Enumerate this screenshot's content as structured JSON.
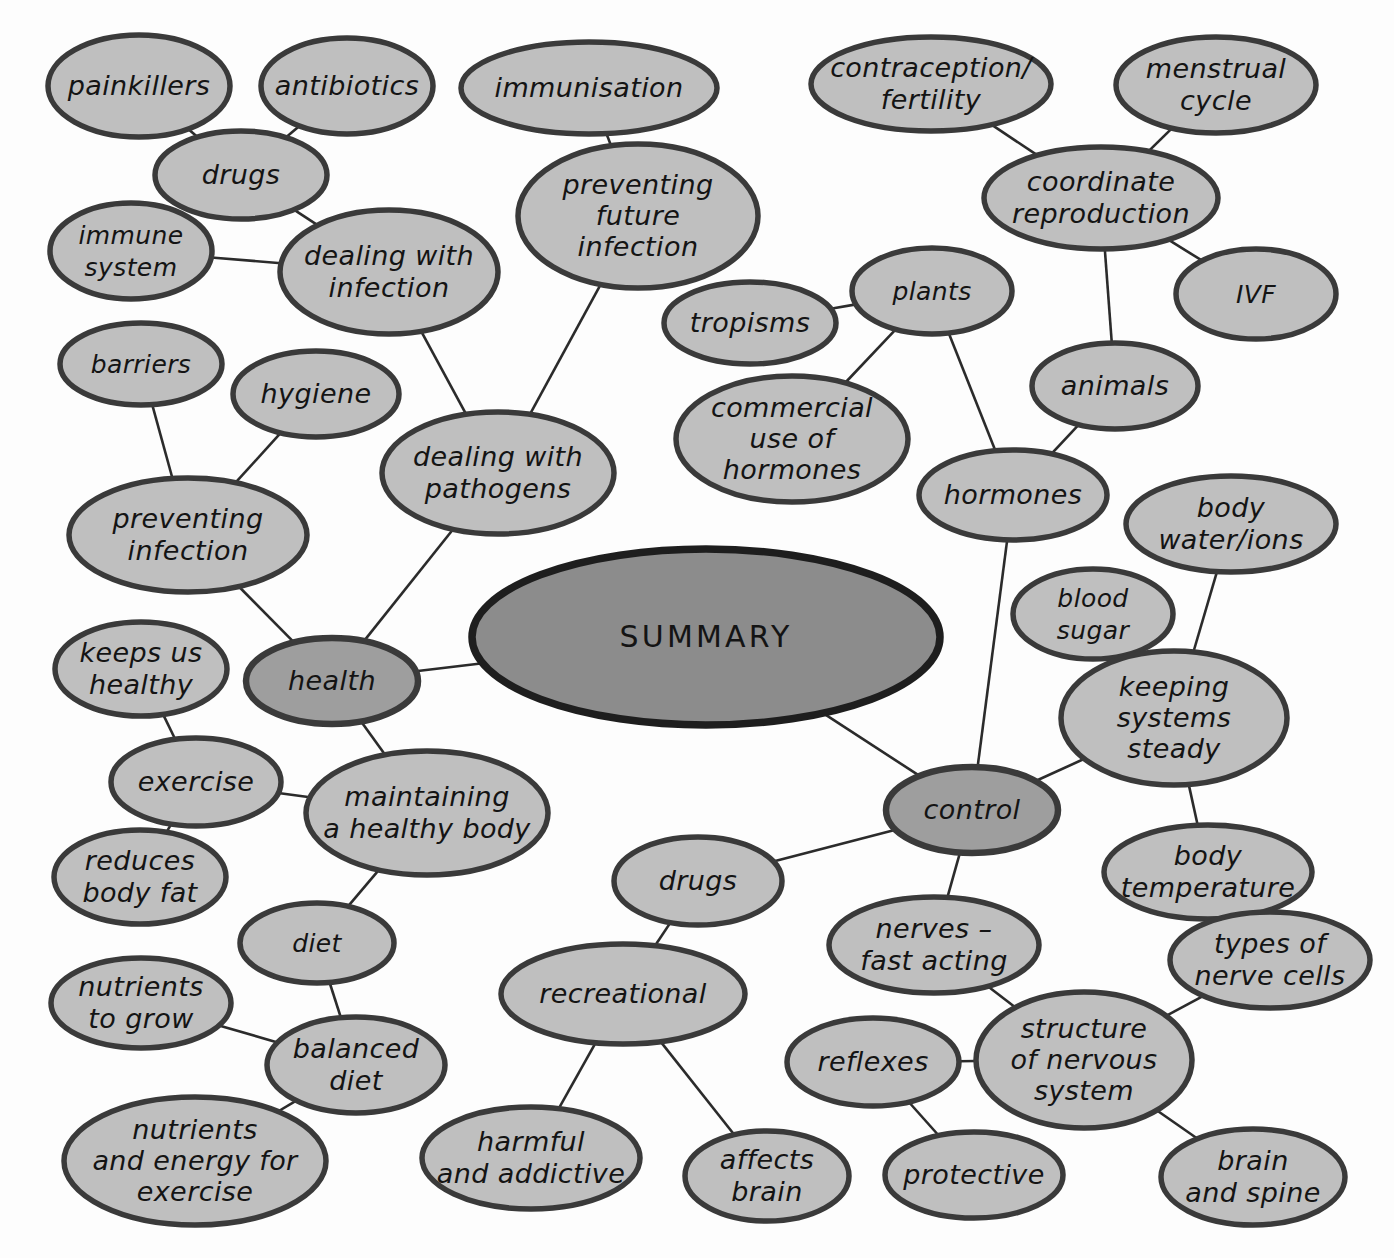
{
  "diagram": {
    "title": "SUMMARY",
    "type": "mind-map",
    "colors": {
      "center_fill": "#8c8c8c",
      "level1_fill": "#9e9e9e",
      "node_fill": "#bfbfbf",
      "stroke": "#3a3a3a",
      "edge": "#2b2b2b",
      "text": "#141414",
      "background": "#ffffff"
    },
    "nodes": [
      {
        "id": "summary",
        "label": "SUMMARY",
        "lines": [
          "SUMMARY"
        ],
        "cx": 706,
        "cy": 637,
        "rx": 234,
        "ry": 88,
        "tier": "center"
      },
      {
        "id": "health",
        "label": "health",
        "lines": [
          "health"
        ],
        "cx": 332,
        "cy": 681,
        "rx": 86,
        "ry": 43,
        "tier": "level1"
      },
      {
        "id": "control",
        "label": "control",
        "lines": [
          "control"
        ],
        "cx": 972,
        "cy": 810,
        "rx": 86,
        "ry": 43,
        "tier": "level1"
      },
      {
        "id": "painkillers",
        "label": "painkillers",
        "lines": [
          "painkillers"
        ],
        "cx": 139,
        "cy": 86,
        "rx": 91,
        "ry": 51,
        "tier": "node"
      },
      {
        "id": "antibiotics",
        "label": "antibiotics",
        "lines": [
          "antibiotics"
        ],
        "cx": 347,
        "cy": 86,
        "rx": 86,
        "ry": 48,
        "tier": "node"
      },
      {
        "id": "drugs_top",
        "label": "drugs",
        "lines": [
          "drugs"
        ],
        "cx": 241,
        "cy": 175,
        "rx": 86,
        "ry": 44,
        "tier": "node"
      },
      {
        "id": "immune",
        "label": "immune system",
        "lines": [
          "immune",
          "system"
        ],
        "cx": 131,
        "cy": 251,
        "rx": 81,
        "ry": 48,
        "tier": "node"
      },
      {
        "id": "dealinfect",
        "label": "dealing with infection",
        "lines": [
          "dealing with",
          "infection"
        ],
        "cx": 389,
        "cy": 272,
        "rx": 109,
        "ry": 62,
        "tier": "node"
      },
      {
        "id": "barriers",
        "label": "barriers",
        "lines": [
          "barriers"
        ],
        "cx": 141,
        "cy": 364,
        "rx": 81,
        "ry": 41,
        "tier": "node"
      },
      {
        "id": "hygiene",
        "label": "hygiene",
        "lines": [
          "hygiene"
        ],
        "cx": 316,
        "cy": 394,
        "rx": 83,
        "ry": 43,
        "tier": "node"
      },
      {
        "id": "previnfect",
        "label": "preventing infection",
        "lines": [
          "preventing",
          "infection"
        ],
        "cx": 188,
        "cy": 535,
        "rx": 119,
        "ry": 57,
        "tier": "node"
      },
      {
        "id": "immunisation",
        "label": "immunisation",
        "lines": [
          "immunisation"
        ],
        "cx": 589,
        "cy": 88,
        "rx": 128,
        "ry": 46,
        "tier": "node"
      },
      {
        "id": "prevfuture",
        "label": "preventing future infection",
        "lines": [
          "preventing",
          "future",
          "infection"
        ],
        "cx": 638,
        "cy": 216,
        "rx": 120,
        "ry": 72,
        "tier": "node"
      },
      {
        "id": "dealpath",
        "label": "dealing with pathogens",
        "lines": [
          "dealing with",
          "pathogens"
        ],
        "cx": 498,
        "cy": 473,
        "rx": 116,
        "ry": 61,
        "tier": "node"
      },
      {
        "id": "keepshealthy",
        "label": "keeps us healthy",
        "lines": [
          "keeps us",
          "healthy"
        ],
        "cx": 141,
        "cy": 669,
        "rx": 86,
        "ry": 47,
        "tier": "node"
      },
      {
        "id": "exercise",
        "label": "exercise",
        "lines": [
          "exercise"
        ],
        "cx": 196,
        "cy": 782,
        "rx": 85,
        "ry": 44,
        "tier": "node"
      },
      {
        "id": "reducesfat",
        "label": "reduces body fat",
        "lines": [
          "reduces",
          "body fat"
        ],
        "cx": 140,
        "cy": 877,
        "rx": 86,
        "ry": 47,
        "tier": "node"
      },
      {
        "id": "maintain",
        "label": "maintaining a healthy body",
        "lines": [
          "maintaining",
          "a healthy body"
        ],
        "cx": 427,
        "cy": 813,
        "rx": 121,
        "ry": 62,
        "tier": "node"
      },
      {
        "id": "diet",
        "label": "diet",
        "lines": [
          "diet"
        ],
        "cx": 317,
        "cy": 943,
        "rx": 77,
        "ry": 40,
        "tier": "node"
      },
      {
        "id": "nutgrow",
        "label": "nutrients to grow",
        "lines": [
          "nutrients",
          "to grow"
        ],
        "cx": 141,
        "cy": 1003,
        "rx": 90,
        "ry": 45,
        "tier": "node"
      },
      {
        "id": "baldiet",
        "label": "balanced diet",
        "lines": [
          "balanced",
          "diet"
        ],
        "cx": 356,
        "cy": 1065,
        "rx": 89,
        "ry": 48,
        "tier": "node"
      },
      {
        "id": "nutenergy",
        "label": "nutrients and energy for exercise",
        "lines": [
          "nutrients",
          "and energy for",
          "exercise"
        ],
        "cx": 195,
        "cy": 1161,
        "rx": 131,
        "ry": 64,
        "tier": "node"
      },
      {
        "id": "drugs_bot",
        "label": "drugs",
        "lines": [
          "drugs"
        ],
        "cx": 698,
        "cy": 881,
        "rx": 84,
        "ry": 44,
        "tier": "node"
      },
      {
        "id": "recreational",
        "label": "recreational",
        "lines": [
          "recreational"
        ],
        "cx": 623,
        "cy": 994,
        "rx": 122,
        "ry": 50,
        "tier": "node"
      },
      {
        "id": "harmful",
        "label": "harmful and addictive",
        "lines": [
          "harmful",
          "and addictive"
        ],
        "cx": 531,
        "cy": 1158,
        "rx": 109,
        "ry": 51,
        "tier": "node"
      },
      {
        "id": "affects",
        "label": "affects brain",
        "lines": [
          "affects",
          "brain"
        ],
        "cx": 767,
        "cy": 1176,
        "rx": 82,
        "ry": 45,
        "tier": "node"
      },
      {
        "id": "tropisms",
        "label": "tropisms",
        "lines": [
          "tropisms"
        ],
        "cx": 750,
        "cy": 323,
        "rx": 86,
        "ry": 41,
        "tier": "node"
      },
      {
        "id": "plants",
        "label": "plants",
        "lines": [
          "plants"
        ],
        "cx": 932,
        "cy": 291,
        "rx": 80,
        "ry": 43,
        "tier": "node"
      },
      {
        "id": "commuse",
        "label": "commercial use of hormones",
        "lines": [
          "commercial",
          "use of",
          "hormones"
        ],
        "cx": 792,
        "cy": 439,
        "rx": 116,
        "ry": 63,
        "tier": "node"
      },
      {
        "id": "contracept",
        "label": "contraception/ fertility",
        "lines": [
          "contraception/",
          "fertility"
        ],
        "cx": 931,
        "cy": 84,
        "rx": 120,
        "ry": 47,
        "tier": "node"
      },
      {
        "id": "menstrual",
        "label": "menstrual cycle",
        "lines": [
          "menstrual",
          "cycle"
        ],
        "cx": 1216,
        "cy": 85,
        "rx": 100,
        "ry": 48,
        "tier": "node"
      },
      {
        "id": "coordrepro",
        "label": "coordinate reproduction",
        "lines": [
          "coordinate",
          "reproduction"
        ],
        "cx": 1101,
        "cy": 198,
        "rx": 117,
        "ry": 51,
        "tier": "node"
      },
      {
        "id": "ivf",
        "label": "IVF",
        "lines": [
          "IVF"
        ],
        "cx": 1256,
        "cy": 294,
        "rx": 80,
        "ry": 45,
        "tier": "node"
      },
      {
        "id": "animals",
        "label": "animals",
        "lines": [
          "animals"
        ],
        "cx": 1115,
        "cy": 386,
        "rx": 83,
        "ry": 43,
        "tier": "node"
      },
      {
        "id": "hormones",
        "label": "hormones",
        "lines": [
          "hormones"
        ],
        "cx": 1013,
        "cy": 495,
        "rx": 94,
        "ry": 45,
        "tier": "node"
      },
      {
        "id": "bodywater",
        "label": "body water/ions",
        "lines": [
          "body",
          "water/ions"
        ],
        "cx": 1231,
        "cy": 524,
        "rx": 105,
        "ry": 48,
        "tier": "node"
      },
      {
        "id": "bloodsugar",
        "label": "blood sugar",
        "lines": [
          "blood",
          "sugar"
        ],
        "cx": 1093,
        "cy": 614,
        "rx": 80,
        "ry": 45,
        "tier": "node"
      },
      {
        "id": "keepsteady",
        "label": "keeping systems steady",
        "lines": [
          "keeping",
          "systems",
          "steady"
        ],
        "cx": 1174,
        "cy": 718,
        "rx": 113,
        "ry": 67,
        "tier": "node"
      },
      {
        "id": "bodytemp",
        "label": "body temperature",
        "lines": [
          "body",
          "temperature"
        ],
        "cx": 1208,
        "cy": 872,
        "rx": 104,
        "ry": 47,
        "tier": "node"
      },
      {
        "id": "nervesfast",
        "label": "nerves – fast acting",
        "lines": [
          "nerves –",
          "fast acting"
        ],
        "cx": 934,
        "cy": 945,
        "rx": 105,
        "ry": 48,
        "tier": "node"
      },
      {
        "id": "typesnerve",
        "label": "types of nerve cells",
        "lines": [
          "types of",
          "nerve cells"
        ],
        "cx": 1270,
        "cy": 960,
        "rx": 100,
        "ry": 48,
        "tier": "node"
      },
      {
        "id": "reflexes",
        "label": "reflexes",
        "lines": [
          "reflexes"
        ],
        "cx": 873,
        "cy": 1062,
        "rx": 86,
        "ry": 44,
        "tier": "node"
      },
      {
        "id": "structnerv",
        "label": "structure of nervous system",
        "lines": [
          "structure",
          "of nervous",
          "system"
        ],
        "cx": 1084,
        "cy": 1060,
        "rx": 108,
        "ry": 68,
        "tier": "node"
      },
      {
        "id": "protective",
        "label": "protective",
        "lines": [
          "protective"
        ],
        "cx": 974,
        "cy": 1175,
        "rx": 89,
        "ry": 43,
        "tier": "node"
      },
      {
        "id": "brainspine",
        "label": "brain and spine",
        "lines": [
          "brain",
          "and spine"
        ],
        "cx": 1253,
        "cy": 1177,
        "rx": 92,
        "ry": 48,
        "tier": "node"
      }
    ],
    "edges": [
      [
        "painkillers",
        "drugs_top"
      ],
      [
        "antibiotics",
        "drugs_top"
      ],
      [
        "drugs_top",
        "dealinfect"
      ],
      [
        "immune",
        "dealinfect"
      ],
      [
        "dealinfect",
        "dealpath"
      ],
      [
        "barriers",
        "previnfect"
      ],
      [
        "hygiene",
        "previnfect"
      ],
      [
        "previnfect",
        "health"
      ],
      [
        "immunisation",
        "prevfuture"
      ],
      [
        "prevfuture",
        "dealpath"
      ],
      [
        "dealpath",
        "health"
      ],
      [
        "health",
        "summary"
      ],
      [
        "keepshealthy",
        "exercise"
      ],
      [
        "exercise",
        "reducesfat"
      ],
      [
        "exercise",
        "maintain"
      ],
      [
        "health",
        "maintain"
      ],
      [
        "maintain",
        "diet"
      ],
      [
        "diet",
        "baldiet"
      ],
      [
        "nutgrow",
        "baldiet"
      ],
      [
        "baldiet",
        "nutenergy"
      ],
      [
        "drugs_bot",
        "recreational"
      ],
      [
        "drugs_bot",
        "control"
      ],
      [
        "recreational",
        "harmful"
      ],
      [
        "recreational",
        "affects"
      ],
      [
        "tropisms",
        "plants"
      ],
      [
        "plants",
        "commuse"
      ],
      [
        "plants",
        "hormones"
      ],
      [
        "contracept",
        "coordrepro"
      ],
      [
        "menstrual",
        "coordrepro"
      ],
      [
        "coordrepro",
        "ivf"
      ],
      [
        "coordrepro",
        "animals"
      ],
      [
        "animals",
        "hormones"
      ],
      [
        "hormones",
        "control"
      ],
      [
        "summary",
        "control"
      ],
      [
        "control",
        "keepsteady"
      ],
      [
        "bloodsugar",
        "keepsteady"
      ],
      [
        "bodywater",
        "keepsteady"
      ],
      [
        "keepsteady",
        "bodytemp"
      ],
      [
        "control",
        "nervesfast"
      ],
      [
        "nervesfast",
        "structnerv"
      ],
      [
        "reflexes",
        "structnerv"
      ],
      [
        "reflexes",
        "protective"
      ],
      [
        "typesnerve",
        "structnerv"
      ],
      [
        "structnerv",
        "brainspine"
      ]
    ]
  }
}
